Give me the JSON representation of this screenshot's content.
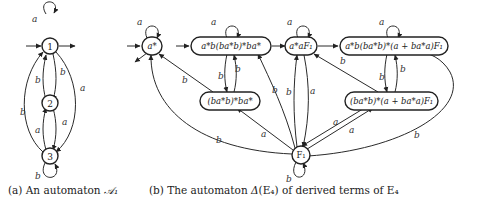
{
  "figure_a": {
    "caption_prefix": "(a) An automaton ",
    "caption_symbol": "𝒜₁",
    "states": [
      {
        "id": "1",
        "label": "1",
        "initial": true,
        "final": true
      },
      {
        "id": "2",
        "label": "2"
      },
      {
        "id": "3",
        "label": "3"
      }
    ],
    "transitions": [
      {
        "from": "1",
        "to": "1",
        "label": "a"
      },
      {
        "from": "1",
        "to": "2",
        "label": "b"
      },
      {
        "from": "2",
        "to": "1",
        "label": "b"
      },
      {
        "from": "1",
        "to": "3",
        "label": "a"
      },
      {
        "from": "3",
        "to": "1",
        "label": "b"
      },
      {
        "from": "2",
        "to": "3",
        "label": "a"
      },
      {
        "from": "3",
        "to": "2",
        "label": "a"
      },
      {
        "from": "3",
        "to": "3",
        "label": "b"
      }
    ],
    "edge_labels": {
      "loop1": "a",
      "e12": "b",
      "e21": "b",
      "e13": "a",
      "e31": "b",
      "e23": "a",
      "e32": "a",
      "loop3": "b"
    }
  },
  "figure_b": {
    "caption_prefix": "(b) The automaton ",
    "caption_delta": "Δ",
    "caption_middle": "(E₄) of derived terms of E₄",
    "states": {
      "s1": "a*",
      "s2": "a*b(ba*b)*ba*",
      "s3": "(ba*b)*ba*",
      "s4": "a*aF₁",
      "s5": "a*b(ba*b)*(a + ba*a)F₁",
      "s6": "(ba*b)*(a + ba*a)F₁",
      "s7": "F₁"
    },
    "edge_labels": {
      "loop_s1": "a",
      "loop_s2": "a",
      "loop_s4": "a",
      "loop_s5": "a",
      "loop_s7": "b",
      "s2_s3": "b",
      "s3_s2": "b",
      "s3_s1": "b",
      "s7_s1": "b",
      "s7_s3": "a",
      "s7_s2": "b",
      "s7_s4a": "b",
      "s4_s7": "a",
      "s5_s6": "b",
      "s6_s5": "b",
      "s6_s4": "b",
      "s7_s6": "a",
      "s6_s7": "a",
      "s7_s5": "b"
    }
  }
}
